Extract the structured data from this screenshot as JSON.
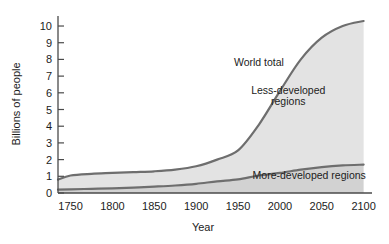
{
  "chart_data": {
    "type": "area",
    "title": "",
    "xlabel": "Year",
    "ylabel": "Billions of people",
    "xlim": [
      1735,
      2110
    ],
    "ylim": [
      0,
      10.6
    ],
    "xticks": [
      1750,
      1800,
      1850,
      1900,
      1950,
      2000,
      2050,
      2100
    ],
    "xtick_labels": [
      "1750",
      "1800",
      "1850",
      "1900",
      "1950",
      "2000",
      "2050",
      "2100"
    ],
    "yticks": [
      0,
      1,
      2,
      3,
      4,
      5,
      6,
      7,
      8,
      9,
      10
    ],
    "ytick_labels": [
      "0",
      "1",
      "2",
      "3",
      "4",
      "5",
      "6",
      "7",
      "8",
      "9",
      "10"
    ],
    "grid": false,
    "legend_position": "inline-annotations",
    "x": [
      1735,
      1750,
      1775,
      1800,
      1825,
      1850,
      1875,
      1900,
      1925,
      1950,
      1975,
      2000,
      2025,
      2050,
      2075,
      2100
    ],
    "series": [
      {
        "name": "World total",
        "label": "World total",
        "color": "#6e6e6e",
        "values": [
          0.8,
          1.05,
          1.15,
          1.2,
          1.25,
          1.3,
          1.4,
          1.6,
          2.0,
          2.55,
          4.1,
          6.1,
          8.0,
          9.3,
          10.0,
          10.3
        ]
      },
      {
        "name": "More-developed regions",
        "label": "More-developed regions",
        "color": "#6e6e6e",
        "values": [
          0.2,
          0.22,
          0.25,
          0.28,
          0.32,
          0.38,
          0.45,
          0.55,
          0.7,
          0.82,
          1.05,
          1.2,
          1.4,
          1.55,
          1.65,
          1.7
        ]
      }
    ],
    "bands": [
      {
        "name": "Less-developed regions",
        "label": "Less-developed regions",
        "color": "#e3e3e3",
        "between": [
          "More-developed regions",
          "World total"
        ]
      },
      {
        "name": "More-developed regions band",
        "label": "More-developed regions",
        "color": "#d2d2d2",
        "between": [
          "baseline",
          "More-developed regions"
        ]
      }
    ],
    "annotations": [
      {
        "text": "World total",
        "x": 1975,
        "y": 7.6,
        "name": "world-total-label"
      },
      {
        "text": "Less-developed",
        "x": 2010,
        "y": 5.9,
        "name": "less-developed-label-line1"
      },
      {
        "text": "regions",
        "x": 2010,
        "y": 5.3,
        "name": "less-developed-label-line2"
      },
      {
        "text": "More-developed regions",
        "x": 2035,
        "y": 0.85,
        "name": "more-developed-label"
      }
    ]
  }
}
